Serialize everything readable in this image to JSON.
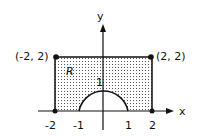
{
  "axes": {
    "x_label": "x",
    "y_label": "y"
  },
  "x_ticks": [
    "-2",
    "-1",
    "1",
    "2"
  ],
  "points": [
    {
      "label": "(-2, 2)",
      "x": -2,
      "y": 2
    },
    {
      "label": "(2, 2)",
      "x": 2,
      "y": 2
    }
  ],
  "region_label": "R",
  "semicircle_tick": "1",
  "colors": {
    "stroke": "#111111",
    "dots": "#555555"
  }
}
